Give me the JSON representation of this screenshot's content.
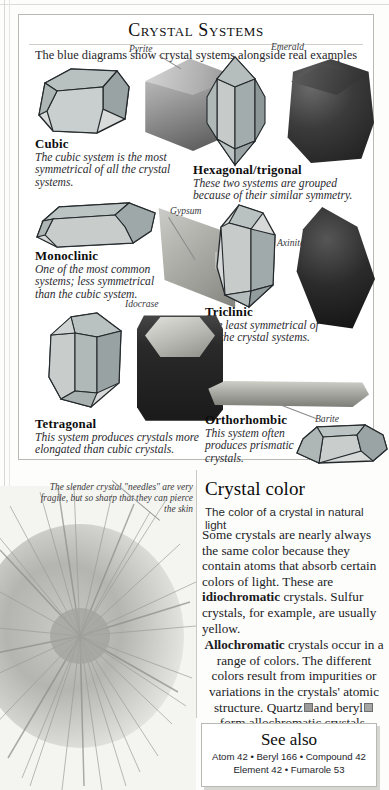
{
  "page": {
    "background_color": "#fdfdfb",
    "border_color": "#b9b9b4"
  },
  "systems_panel": {
    "title": "Crystal Systems",
    "subtitle": "The blue diagrams show crystal systems alongside real examples",
    "entries": [
      {
        "id": "cubic",
        "name": "Cubic",
        "description": "The cubic system is the most symmetrical of all the crystal systems.",
        "specimen_label": "Pyrite"
      },
      {
        "id": "hexagonal-trigonal",
        "name": "Hexagonal/trigonal",
        "description": "These two systems are grouped because of their similar symmetry.",
        "specimen_label": "Emerald"
      },
      {
        "id": "monoclinic",
        "name": "Monoclinic",
        "description": "One of the most common systems; less symmetrical than the cubic system.",
        "specimen_label": "Gypsum"
      },
      {
        "id": "triclinic",
        "name": "Triclinic",
        "description": "The least symmetrical of all the crystal systems.",
        "specimen_label": "Axinite"
      },
      {
        "id": "tetragonal",
        "name": "Tetragonal",
        "description": "This system produces crystals more elongated than cubic crystals.",
        "specimen_label": "Idocrase"
      },
      {
        "id": "orthorhombic",
        "name": "Orthorhombic",
        "description": "This system often produces prismatic crystals.",
        "specimen_label": "Barite"
      }
    ]
  },
  "needle_photo": {
    "caption": "The slender crystal \"needles\" are very fragile, but so sharp that they can pierce the skin"
  },
  "crystal_color": {
    "heading": "Crystal color",
    "subheading": "The color of a crystal in natural light",
    "para1": "Some crystals are nearly always the same color because they contain atoms that absorb certain colors of light. These are idiochromatic crystals. Sulfur crystals, for example, are usually yellow.",
    "para1_bold_term": "idiochromatic",
    "para2_bold_term": "Allochromatic",
    "para2": "crystals occur in a range of colors. The different colors result from impurities or variations in the crystals' atomic structure.",
    "para3_prefix": "Quartz",
    "para3_mid": "and beryl",
    "para3_suffix": "form allochromatic crystals.",
    "swatch_quartz_color": "#9b9b9b",
    "swatch_beryl_color": "#a6a6a6"
  },
  "see_also": {
    "title": "See also",
    "line1": "Atom 42 • Beryl 166 • Compound 42",
    "line2": "Element 42 • Fumarole 53"
  }
}
